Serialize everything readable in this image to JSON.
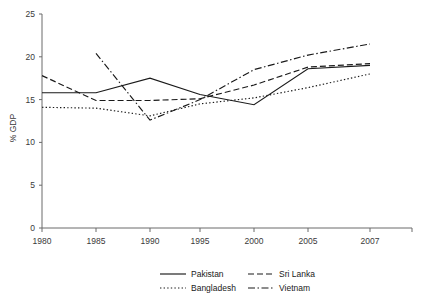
{
  "chart_data": {
    "type": "line",
    "title": "",
    "subtitle": "",
    "xlabel": "",
    "ylabel": "% GDP",
    "x": [
      1980,
      1985,
      1990,
      1995,
      2000,
      2005,
      2007
    ],
    "xtick_labels": [
      "1980",
      "1985",
      "1990",
      "1995",
      "2000",
      "2005",
      "2007"
    ],
    "ytick_labels": [
      "0",
      "5",
      "10",
      "15",
      "20",
      "25"
    ],
    "yticks": [
      0,
      5,
      10,
      15,
      20,
      25
    ],
    "xlim": [
      1980,
      2007
    ],
    "ylim": [
      0,
      25
    ],
    "grid": false,
    "legend_position": "bottom",
    "series": [
      {
        "name": "Pakistan",
        "style": "solid",
        "color": "#1a1a1a",
        "x": [
          1980,
          1985,
          1990,
          1995,
          2000,
          2005,
          2007
        ],
        "values": [
          15.8,
          15.8,
          17.5,
          15.6,
          14.4,
          18.6,
          19.0
        ]
      },
      {
        "name": "Sri Lanka",
        "style": "dashed",
        "color": "#1a1a1a",
        "x": [
          1980,
          1985,
          1990,
          1995,
          2000,
          2005,
          2007
        ],
        "values": [
          17.8,
          14.9,
          14.9,
          15.1,
          16.7,
          18.8,
          19.2
        ]
      },
      {
        "name": "Bangladesh",
        "style": "dotted",
        "color": "#1a1a1a",
        "x": [
          1980,
          1985,
          1990,
          1995,
          2000,
          2005,
          2007
        ],
        "values": [
          14.1,
          14.0,
          13.1,
          14.5,
          15.2,
          16.4,
          18.0
        ]
      },
      {
        "name": "Vietnam",
        "style": "dashdot",
        "color": "#1a1a1a",
        "x": [
          1985,
          1990,
          1995,
          2000,
          2005,
          2007
        ],
        "values": [
          20.4,
          12.6,
          15.0,
          18.5,
          20.2,
          21.5
        ]
      }
    ]
  },
  "axes": {
    "y_axis_title": "% GDP"
  },
  "legend": {
    "entries": [
      {
        "label": "Pakistan",
        "style": "solid"
      },
      {
        "label": "Sri Lanka",
        "style": "dashed"
      },
      {
        "label": "Bangladesh",
        "style": "dotted"
      },
      {
        "label": "Vietnam",
        "style": "dashdot"
      }
    ]
  }
}
